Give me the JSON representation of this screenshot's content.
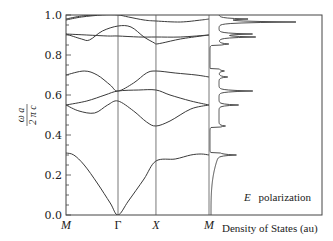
{
  "chart_data": {
    "type": "line",
    "title": "",
    "subtitle": "",
    "xlabel": "",
    "ylabel": "ω a / 2 π c",
    "ylim": [
      0.0,
      1.0
    ],
    "yticks": [
      "0.0",
      "0.2",
      "0.4",
      "0.6",
      "0.8",
      "1.0"
    ],
    "ytick_values": [
      0.0,
      0.2,
      0.4,
      0.6,
      0.8,
      1.0
    ],
    "grid": false,
    "legend": null,
    "annotation": {
      "symbol": "E",
      "text": "polarization"
    },
    "band_structure": {
      "k_points": [
        {
          "label": "M",
          "pos": 0.0,
          "italic": true
        },
        {
          "label": "Γ",
          "pos": 1.0,
          "italic": false
        },
        {
          "label": "X",
          "pos": 1.73,
          "italic": true
        },
        {
          "label": "M",
          "pos": 2.75,
          "italic": true
        }
      ],
      "bands": [
        {
          "name": "band 1",
          "points": [
            [
              0.0,
              0.31
            ],
            [
              0.15,
              0.3
            ],
            [
              0.35,
              0.25
            ],
            [
              0.6,
              0.16
            ],
            [
              0.85,
              0.06
            ],
            [
              1.0,
              0.0
            ],
            [
              1.2,
              0.07
            ],
            [
              1.5,
              0.18
            ],
            [
              1.73,
              0.27
            ],
            [
              2.1,
              0.28
            ],
            [
              2.4,
              0.3
            ],
            [
              2.6,
              0.305
            ],
            [
              2.75,
              0.3
            ]
          ]
        },
        {
          "name": "band 2",
          "points": [
            [
              0.0,
              0.55
            ],
            [
              0.25,
              0.52
            ],
            [
              0.55,
              0.51
            ],
            [
              0.8,
              0.55
            ],
            [
              1.0,
              0.57
            ],
            [
              1.3,
              0.52
            ],
            [
              1.55,
              0.465
            ],
            [
              1.73,
              0.445
            ],
            [
              2.0,
              0.47
            ],
            [
              2.4,
              0.53
            ],
            [
              2.75,
              0.55
            ]
          ]
        },
        {
          "name": "band 3",
          "points": [
            [
              0.0,
              0.55
            ],
            [
              0.4,
              0.57
            ],
            [
              0.75,
              0.6
            ],
            [
              1.0,
              0.62
            ],
            [
              1.4,
              0.625
            ],
            [
              1.73,
              0.625
            ],
            [
              2.0,
              0.6
            ],
            [
              2.4,
              0.57
            ],
            [
              2.75,
              0.55
            ]
          ]
        },
        {
          "name": "band 4",
          "points": [
            [
              0.0,
              0.7
            ],
            [
              0.35,
              0.72
            ],
            [
              0.6,
              0.7
            ],
            [
              0.85,
              0.65
            ],
            [
              1.0,
              0.62
            ],
            [
              1.3,
              0.66
            ],
            [
              1.55,
              0.71
            ],
            [
              1.73,
              0.72
            ],
            [
              2.1,
              0.71
            ],
            [
              2.5,
              0.7
            ],
            [
              2.75,
              0.69
            ]
          ]
        },
        {
          "name": "band 5",
          "points": [
            [
              0.0,
              0.905
            ],
            [
              0.3,
              0.88
            ],
            [
              0.45,
              0.875
            ],
            [
              0.7,
              0.92
            ],
            [
              1.0,
              0.945
            ],
            [
              1.25,
              0.94
            ],
            [
              1.5,
              0.89
            ],
            [
              1.7,
              0.86
            ],
            [
              1.73,
              0.855
            ],
            [
              1.85,
              0.86
            ],
            [
              2.2,
              0.88
            ],
            [
              2.6,
              0.895
            ],
            [
              2.75,
              0.9
            ]
          ]
        },
        {
          "name": "band 6",
          "points": [
            [
              0.0,
              0.905
            ],
            [
              0.4,
              0.9
            ],
            [
              0.8,
              0.895
            ],
            [
              1.0,
              0.895
            ],
            [
              1.4,
              0.89
            ],
            [
              1.73,
              0.89
            ],
            [
              2.2,
              0.89
            ],
            [
              2.75,
              0.9
            ]
          ]
        },
        {
          "name": "band 7",
          "points": [
            [
              0.0,
              0.975
            ],
            [
              0.3,
              0.99
            ],
            [
              0.7,
              1.0
            ],
            [
              1.0,
              1.0
            ],
            [
              1.2,
              0.99
            ],
            [
              1.5,
              0.975
            ],
            [
              1.73,
              0.97
            ],
            [
              2.2,
              0.965
            ],
            [
              2.6,
              0.975
            ],
            [
              2.75,
              0.98
            ]
          ]
        },
        {
          "name": "band 8",
          "points": [
            [
              0.0,
              0.98
            ],
            [
              0.3,
              0.995
            ],
            [
              0.6,
              1.0
            ]
          ]
        }
      ]
    },
    "dos_panel": {
      "xlabel": "Density of States (au)",
      "peaks": [
        {
          "omega": 0.3,
          "height": 0.16
        },
        {
          "omega": 0.445,
          "height": 0.06
        },
        {
          "omega": 0.55,
          "height": 0.18
        },
        {
          "omega": 0.62,
          "height": 0.31
        },
        {
          "omega": 0.69,
          "height": 0.08
        },
        {
          "omega": 0.72,
          "height": 0.05
        },
        {
          "omega": 0.855,
          "height": 0.09
        },
        {
          "omega": 0.89,
          "height": 0.33
        },
        {
          "omega": 0.905,
          "height": 0.3
        },
        {
          "omega": 0.965,
          "height": 0.7
        },
        {
          "omega": 0.98,
          "height": 0.25
        }
      ]
    }
  },
  "labels": {
    "y_num": "ω a",
    "y_den": "2 π c",
    "polarization_symbol": "E",
    "polarization_text": "polarization",
    "dos_xlabel": "Density of States (au)"
  }
}
